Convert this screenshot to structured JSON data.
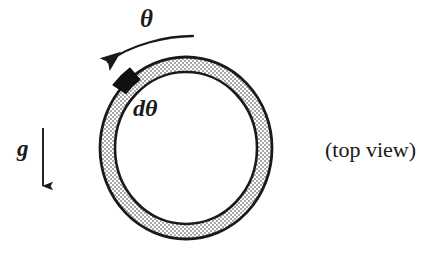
{
  "figure": {
    "name": "rotating-ring-top-view-diagram",
    "caption": "(top view)",
    "background_color": "#ffffff",
    "ink_color": "#1a1a1a",
    "width": 446,
    "height": 255
  },
  "labels": {
    "theta": "θ",
    "d_theta": "dθ",
    "gravity": "g",
    "view_note": "(top view)"
  },
  "ring": {
    "name": "annulus-ring",
    "center_x": 186,
    "center_y": 148,
    "outer_radius_x": 86,
    "outer_radius_y": 91,
    "thickness": 15,
    "fill_pattern": "stipple-dots",
    "fill_color": "#d9d9d9",
    "stroke_color": "#1a1a1a",
    "stroke_width": 2.6
  },
  "bead": {
    "name": "bead-mass-element",
    "label": "dθ",
    "angle_degrees": 131,
    "fill_color": "#111111",
    "arc_span_degrees": 13
  },
  "theta_arrow": {
    "name": "theta-rotation-arrow",
    "direction": "counterclockwise",
    "start_x": 192,
    "start_y": 36,
    "end_x": 106,
    "end_y": 63,
    "stroke_color": "#1a1a1a"
  },
  "gravity_arrow": {
    "name": "gravity-direction-arrow",
    "direction": "down",
    "x": 43,
    "top_y": 128,
    "bottom_y": 197,
    "stroke_color": "#1a1a1a"
  }
}
